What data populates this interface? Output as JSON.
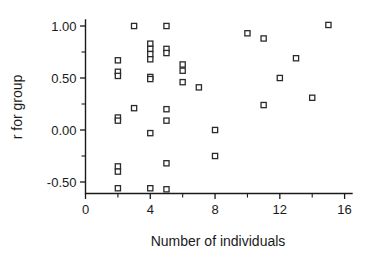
{
  "chart_data": {
    "type": "scatter",
    "title": "",
    "xlabel": "Number of individuals",
    "ylabel": "r for group",
    "xlim": [
      0,
      16.3
    ],
    "ylim": [
      -0.62,
      1.08
    ],
    "grid": false,
    "legend": null,
    "marker": "open-square",
    "xticks": [
      0,
      2,
      4,
      6,
      8,
      10,
      12,
      14,
      16
    ],
    "xticklabels": [
      "0",
      "",
      "4",
      "",
      "8",
      "",
      "12",
      "",
      "16"
    ],
    "xtick_labeled": [
      0,
      4,
      8,
      12,
      16
    ],
    "yticks": [
      -0.5,
      -0.25,
      0.0,
      0.25,
      0.5,
      0.75,
      1.0
    ],
    "yticklabels": [
      "-0.50",
      "",
      "0.00",
      "",
      "0.50",
      "",
      "1.00"
    ],
    "ytick_labeled": [
      -0.5,
      0.0,
      0.5,
      1.0
    ],
    "ytick_label_text": {
      "1.00": "1.00",
      "0.50": "0.50",
      "0.00": "0.00",
      "-0.50": "-0.50"
    },
    "points": [
      {
        "x": 2,
        "y": 0.67
      },
      {
        "x": 2,
        "y": 0.56
      },
      {
        "x": 2,
        "y": 0.52
      },
      {
        "x": 2,
        "y": 0.12
      },
      {
        "x": 2,
        "y": 0.09
      },
      {
        "x": 2,
        "y": -0.35
      },
      {
        "x": 2,
        "y": -0.4
      },
      {
        "x": 2,
        "y": -0.56
      },
      {
        "x": 3,
        "y": 1.0
      },
      {
        "x": 3,
        "y": 0.21
      },
      {
        "x": 4,
        "y": 0.83
      },
      {
        "x": 4,
        "y": 0.78
      },
      {
        "x": 4,
        "y": 0.73
      },
      {
        "x": 4,
        "y": 0.68
      },
      {
        "x": 4,
        "y": 0.51
      },
      {
        "x": 4,
        "y": 0.49
      },
      {
        "x": 4,
        "y": -0.03
      },
      {
        "x": 4,
        "y": -0.56
      },
      {
        "x": 5,
        "y": 1.0
      },
      {
        "x": 5,
        "y": 0.78
      },
      {
        "x": 5,
        "y": 0.74
      },
      {
        "x": 5,
        "y": 0.2
      },
      {
        "x": 5,
        "y": 0.09
      },
      {
        "x": 5,
        "y": -0.32
      },
      {
        "x": 5,
        "y": -0.57
      },
      {
        "x": 6,
        "y": 0.63
      },
      {
        "x": 6,
        "y": 0.57
      },
      {
        "x": 6,
        "y": 0.46
      },
      {
        "x": 7,
        "y": 0.41
      },
      {
        "x": 8,
        "y": 0.0
      },
      {
        "x": 8,
        "y": -0.25
      },
      {
        "x": 10,
        "y": 0.93
      },
      {
        "x": 11,
        "y": 0.88
      },
      {
        "x": 11,
        "y": 0.24
      },
      {
        "x": 12,
        "y": 0.5
      },
      {
        "x": 13,
        "y": 0.69
      },
      {
        "x": 14,
        "y": 0.31
      },
      {
        "x": 15,
        "y": 1.01
      }
    ]
  },
  "colors": {
    "axis": "#1a1a1a",
    "marker_stroke": "#2b2b2b",
    "marker_fill": "#ffffff",
    "background": "#ffffff"
  }
}
